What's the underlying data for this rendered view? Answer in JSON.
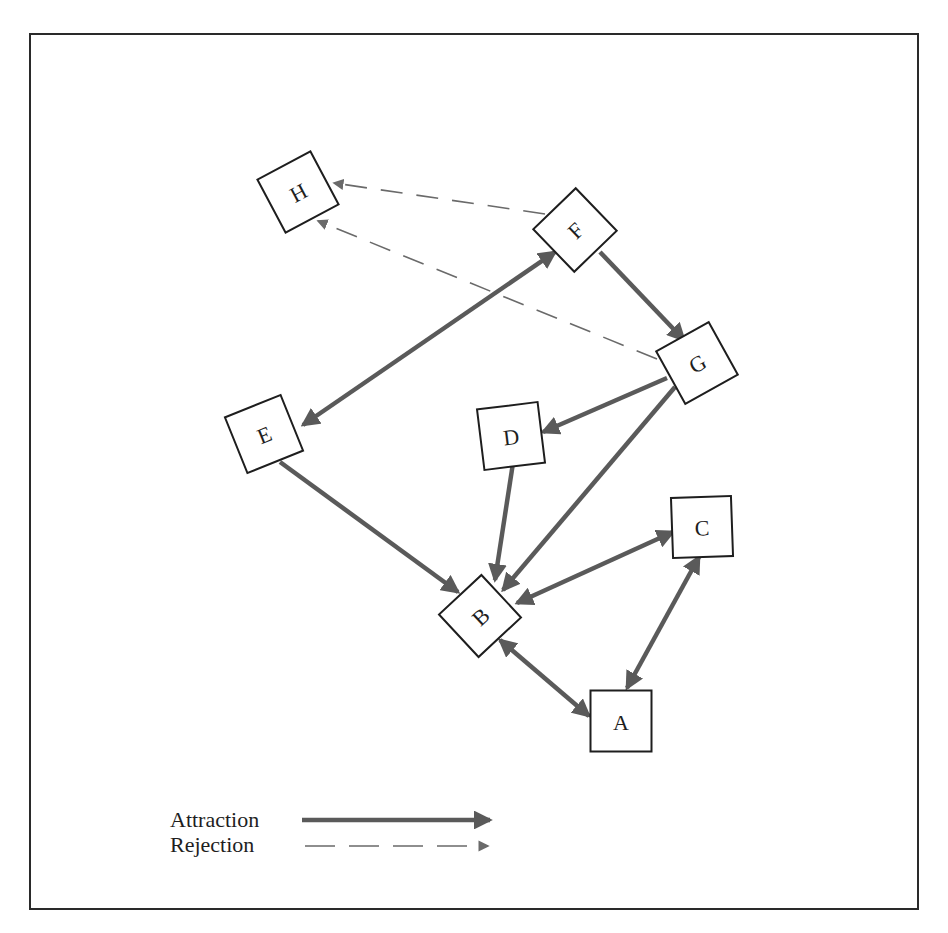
{
  "diagram": {
    "type": "sociogram",
    "colors": {
      "attraction": "#5a5a5a",
      "rejection": "#6a6a6a",
      "node_border": "#1e1e1e",
      "frame": "#2a2a2a"
    },
    "nodes": [
      {
        "id": "A",
        "label": "A",
        "cx": 621,
        "cy": 721,
        "size": 61,
        "rotation": 0
      },
      {
        "id": "B",
        "label": "B",
        "cx": 480,
        "cy": 616,
        "size": 58,
        "rotation": -43
      },
      {
        "id": "C",
        "label": "C",
        "cx": 702,
        "cy": 527,
        "size": 60,
        "rotation": -2
      },
      {
        "id": "D",
        "label": "D",
        "cx": 511,
        "cy": 436,
        "size": 61,
        "rotation": -7
      },
      {
        "id": "E",
        "label": "E",
        "cx": 264,
        "cy": 434,
        "size": 60,
        "rotation": -22
      },
      {
        "id": "F",
        "label": "F",
        "cx": 575,
        "cy": 230,
        "size": 59,
        "rotation": -44
      },
      {
        "id": "G",
        "label": "G",
        "cx": 697,
        "cy": 363,
        "size": 60,
        "rotation": -29
      },
      {
        "id": "H",
        "label": "H",
        "cx": 298,
        "cy": 192,
        "size": 60,
        "rotation": -28
      }
    ],
    "edges": [
      {
        "from": "E",
        "to": "F",
        "type": "attraction",
        "direction": "both",
        "x1": 303,
        "y1": 425,
        "x2": 555,
        "y2": 252
      },
      {
        "from": "F",
        "to": "G",
        "type": "attraction",
        "direction": "forward",
        "x1": 600,
        "y1": 252,
        "x2": 684,
        "y2": 340
      },
      {
        "from": "G",
        "to": "D",
        "type": "attraction",
        "direction": "forward",
        "x1": 667,
        "y1": 378,
        "x2": 543,
        "y2": 432
      },
      {
        "from": "G",
        "to": "B",
        "type": "attraction",
        "direction": "forward",
        "x1": 675,
        "y1": 387,
        "x2": 503,
        "y2": 590
      },
      {
        "from": "E",
        "to": "B",
        "type": "attraction",
        "direction": "forward",
        "x1": 280,
        "y1": 462,
        "x2": 458,
        "y2": 592
      },
      {
        "from": "D",
        "to": "B",
        "type": "attraction",
        "direction": "forward",
        "x1": 513,
        "y1": 463,
        "x2": 495,
        "y2": 580
      },
      {
        "from": "B",
        "to": "C",
        "type": "attraction",
        "direction": "both",
        "x1": 517,
        "y1": 603,
        "x2": 673,
        "y2": 532
      },
      {
        "from": "B",
        "to": "A",
        "type": "attraction",
        "direction": "both",
        "x1": 500,
        "y1": 640,
        "x2": 589,
        "y2": 716
      },
      {
        "from": "A",
        "to": "C",
        "type": "attraction",
        "direction": "both",
        "x1": 627,
        "y1": 688,
        "x2": 699,
        "y2": 557
      },
      {
        "from": "F",
        "to": "H",
        "type": "rejection",
        "direction": "forward",
        "x1": 545,
        "y1": 214,
        "x2": 334,
        "y2": 183
      },
      {
        "from": "G",
        "to": "H",
        "type": "rejection",
        "direction": "forward",
        "x1": 657,
        "y1": 359,
        "x2": 318,
        "y2": 221
      }
    ]
  },
  "legend": {
    "items": [
      {
        "label": "Attraction",
        "type": "attraction"
      },
      {
        "label": "Rejection",
        "type": "rejection"
      }
    ]
  }
}
